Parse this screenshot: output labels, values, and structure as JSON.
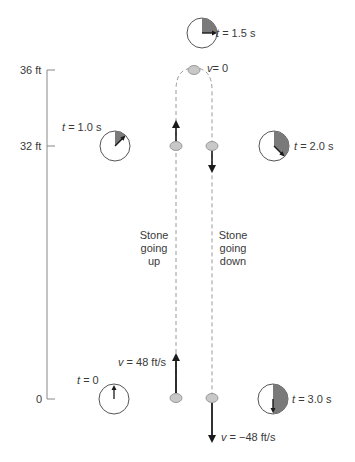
{
  "axis": {
    "ticks": [
      {
        "label": "36 ft",
        "value": 36
      },
      {
        "label": "32 ft",
        "value": 32
      },
      {
        "label": "0",
        "value": 0
      }
    ]
  },
  "clocks": [
    {
      "t_var": "t",
      "t_label": "= 0",
      "time_s": 0,
      "fraction": 0.0
    },
    {
      "t_var": "t",
      "t_label": "= 1.0 s",
      "time_s": 1.0,
      "fraction": 0.125
    },
    {
      "t_var": "t",
      "t_label": "= 1.5 s",
      "time_s": 1.5,
      "fraction": 0.25
    },
    {
      "t_var": "t",
      "t_label": "= 2.0 s",
      "time_s": 2.0,
      "fraction": 0.375
    },
    {
      "t_var": "t",
      "t_label": "= 3.0 s",
      "time_s": 3.0,
      "fraction": 0.5
    }
  ],
  "velocities": {
    "top": {
      "var": "v",
      "text": "= 0"
    },
    "launch": {
      "var": "v",
      "text": "= 48 ft/s"
    },
    "impact": {
      "var": "v",
      "text": "= −48 ft/s"
    }
  },
  "captions": {
    "up": [
      "Stone",
      "going",
      "up"
    ],
    "down": [
      "Stone",
      "going",
      "down"
    ]
  },
  "colors": {
    "stone": "#c8c8c8",
    "wedge": "#6e6e6e",
    "path": "#9a9a9a",
    "arrow": "#1a1a1a"
  }
}
